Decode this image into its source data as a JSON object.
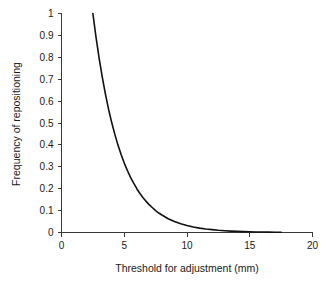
{
  "chart_data": {
    "type": "line",
    "title": "",
    "xlabel": "Threshold for adjustment (mm)",
    "ylabel": "Frequency of repositioning",
    "xlim": [
      0,
      20
    ],
    "ylim": [
      0,
      1
    ],
    "grid": false,
    "legend": null,
    "xticks": [
      0,
      5,
      10,
      15,
      20
    ],
    "xticklabels": [
      "0",
      "5",
      "10",
      "15",
      "20"
    ],
    "yticks": [
      0,
      0.1,
      0.2,
      0.3,
      0.4,
      0.5,
      0.6,
      0.7,
      0.8,
      0.9,
      1
    ],
    "yticklabels": [
      "0",
      "0.1",
      "0.2",
      "0.3",
      "0.4",
      "0.5",
      "0.6",
      "0.7",
      "0.8",
      "0.9",
      "1"
    ],
    "series": [
      {
        "name": "Frequency of repositioning",
        "color": "#111111",
        "x": [
          2.5,
          2.75,
          3,
          3.25,
          3.5,
          3.75,
          4,
          4.25,
          4.5,
          4.75,
          5,
          5.25,
          5.5,
          5.75,
          6,
          6.25,
          6.5,
          6.75,
          7,
          7.25,
          7.5,
          7.75,
          8,
          8.5,
          9,
          9.5,
          10,
          10.5,
          11,
          11.5,
          12,
          12.5,
          13,
          13.5,
          14,
          14.5,
          15,
          15.5,
          16,
          16.5,
          17,
          17.5
        ],
        "y": [
          1.0,
          0.892,
          0.795,
          0.709,
          0.632,
          0.563,
          0.502,
          0.448,
          0.399,
          0.356,
          0.317,
          0.283,
          0.252,
          0.225,
          0.2,
          0.178,
          0.159,
          0.142,
          0.126,
          0.113,
          0.1,
          0.089,
          0.08,
          0.063,
          0.05,
          0.04,
          0.032,
          0.025,
          0.02,
          0.016,
          0.013,
          0.01,
          0.008,
          0.0065,
          0.005,
          0.004,
          0.0032,
          0.0026,
          0.002,
          0.0016,
          0.0013,
          0.001
        ]
      }
    ]
  },
  "axes": {
    "x_title": "Threshold for adjustment (mm)",
    "y_title": "Frequency of repositioning"
  },
  "colors": {
    "curve": "#111111",
    "axis": "#3a3a3a",
    "text": "#1a1a1a",
    "background": "#ffffff"
  }
}
